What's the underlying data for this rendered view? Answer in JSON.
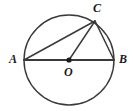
{
  "figure": {
    "kind": "circle-geometry-diagram",
    "background_color": "#ffffff",
    "stroke_color": "#3a3a3a",
    "label_color": "#1a1a1a",
    "canvas": {
      "width": 137,
      "height": 111
    },
    "circle": {
      "cx": 69,
      "cy": 60,
      "r": 45,
      "stroke_width": 1.4
    },
    "center_dot": {
      "cx": 69,
      "cy": 60,
      "r": 2.6,
      "fill": "#1a1a1a"
    },
    "points": [
      {
        "id": "A",
        "label": "A",
        "x": 24,
        "y": 60,
        "label_x": 9,
        "label_y": 53
      },
      {
        "id": "B",
        "label": "B",
        "x": 114,
        "y": 60,
        "label_x": 119,
        "label_y": 53
      },
      {
        "id": "C",
        "label": "C",
        "x": 95,
        "y": 21,
        "label_x": 93,
        "label_y": 2
      },
      {
        "id": "O",
        "label": "O",
        "x": 69,
        "y": 60,
        "label_x": 64,
        "label_y": 66
      }
    ],
    "segments": [
      {
        "id": "AB",
        "from": "A",
        "to": "B",
        "x1": 24,
        "y1": 60,
        "x2": 114,
        "y2": 60,
        "stroke_width": 1.8,
        "name": "diameter-ab"
      },
      {
        "id": "AC",
        "from": "A",
        "to": "C",
        "x1": 24,
        "y1": 60,
        "x2": 95,
        "y2": 21,
        "stroke_width": 1.5,
        "name": "chord-ac"
      },
      {
        "id": "OC",
        "from": "O",
        "to": "C",
        "x1": 69,
        "y1": 60,
        "x2": 95,
        "y2": 21,
        "stroke_width": 1.5,
        "name": "radius-oc"
      },
      {
        "id": "CB",
        "from": "C",
        "to": "B",
        "x1": 95,
        "y1": 21,
        "x2": 114,
        "y2": 60,
        "stroke_width": 1.5,
        "name": "chord-cb"
      }
    ]
  }
}
